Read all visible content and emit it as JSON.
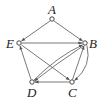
{
  "graph": {
    "type": "directed",
    "nodes": [
      {
        "id": "A",
        "label": "A",
        "x": 52,
        "y": 19
      },
      {
        "id": "B",
        "label": "B",
        "x": 85,
        "y": 43
      },
      {
        "id": "C",
        "label": "C",
        "x": 72,
        "y": 82
      },
      {
        "id": "D",
        "label": "D",
        "x": 32,
        "y": 82
      },
      {
        "id": "E",
        "label": "E",
        "x": 19,
        "y": 43
      }
    ],
    "edges": [
      {
        "from": "A",
        "to": "E"
      },
      {
        "from": "A",
        "to": "B"
      },
      {
        "from": "E",
        "to": "B"
      },
      {
        "from": "E",
        "to": "C"
      },
      {
        "from": "D",
        "to": "E"
      },
      {
        "from": "D",
        "to": "B"
      },
      {
        "from": "B",
        "to": "D"
      },
      {
        "from": "C",
        "to": "B"
      },
      {
        "from": "B",
        "to": "C"
      },
      {
        "from": "C",
        "to": "D"
      }
    ]
  }
}
